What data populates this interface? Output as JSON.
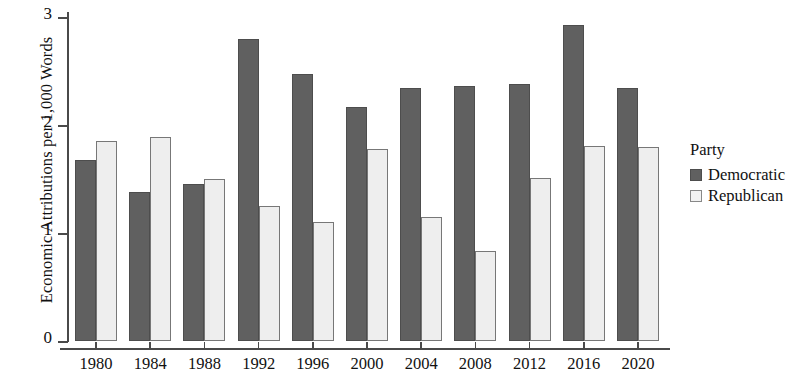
{
  "chart_data": {
    "type": "bar",
    "title": "",
    "xlabel": "",
    "ylabel": "Economic Attributions per 1,000 Words",
    "categories": [
      "1980",
      "1984",
      "1988",
      "1992",
      "1996",
      "2000",
      "2004",
      "2008",
      "2012",
      "2016",
      "2020"
    ],
    "series": [
      {
        "name": "Democratic",
        "color": "#606060",
        "values": [
          1.68,
          1.38,
          1.45,
          2.8,
          2.47,
          2.17,
          2.34,
          2.36,
          2.38,
          2.93,
          2.34
        ]
      },
      {
        "name": "Republican",
        "color": "#eeeeee",
        "values": [
          1.85,
          1.89,
          1.5,
          1.25,
          1.1,
          1.78,
          1.15,
          0.83,
          1.51,
          1.81,
          1.8
        ]
      }
    ],
    "ylim": [
      0,
      3.05
    ],
    "yticks": [
      "0",
      "1",
      "2",
      "3"
    ],
    "ytick_values": [
      0,
      1,
      2,
      3
    ],
    "grid": false,
    "legend_position": "right"
  },
  "legend": {
    "title": "Party",
    "items": [
      {
        "label": "Democratic",
        "swatch": "dem"
      },
      {
        "label": "Republican",
        "swatch": "rep"
      }
    ]
  }
}
